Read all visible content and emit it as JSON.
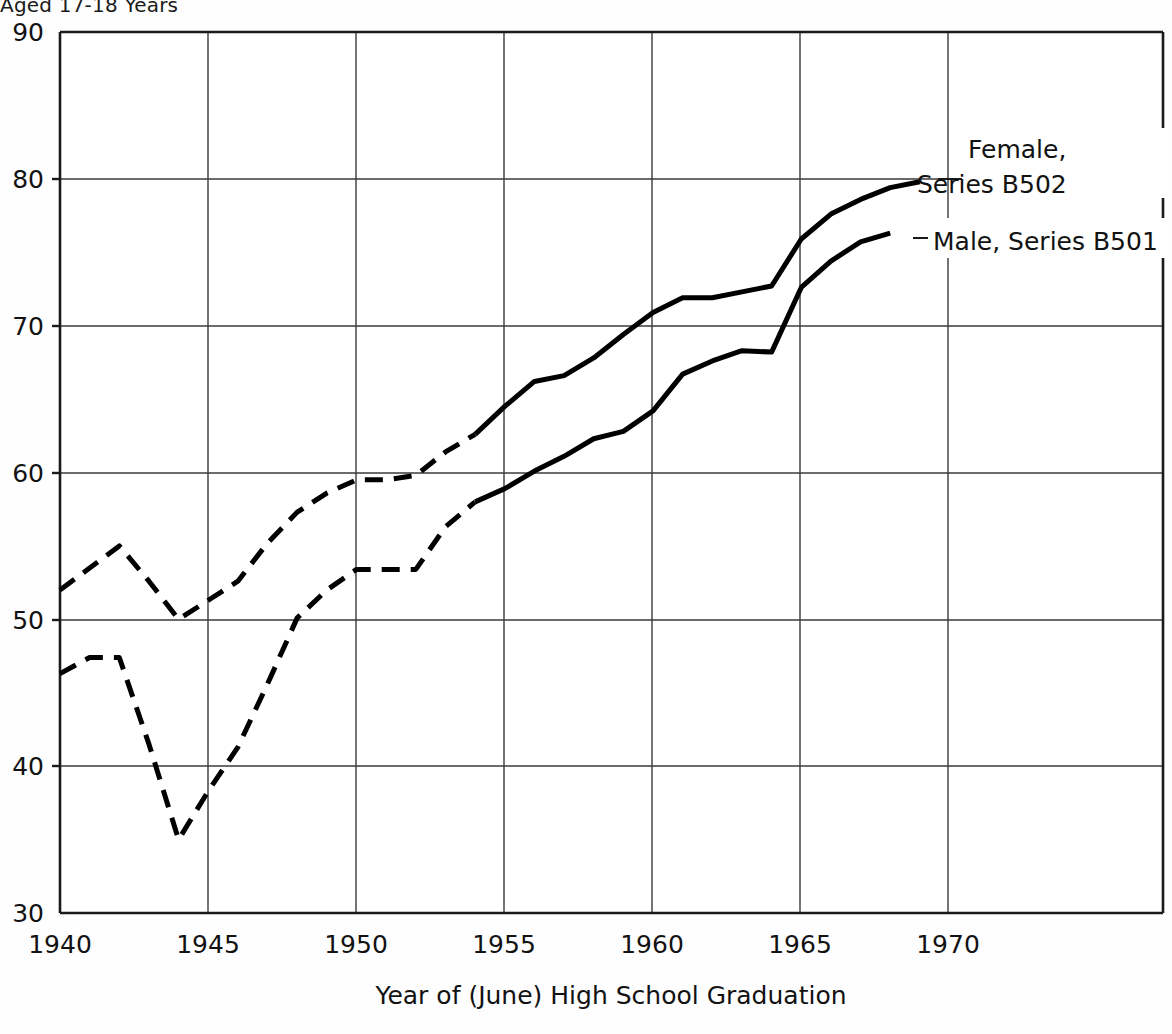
{
  "top_note": "Aged 17-18 Years",
  "chart_data": {
    "type": "line",
    "title": "",
    "xlabel": "Year of (June) High School Graduation",
    "ylabel": "",
    "xlim": [
      1940,
      1977.2
    ],
    "ylim": [
      30,
      90
    ],
    "grid": true,
    "legend_position": "right-inline",
    "x_ticks": [
      1940,
      1945,
      1950,
      1955,
      1960,
      1965,
      1970
    ],
    "x_tick_labels": [
      "1940",
      "1945",
      "1950",
      "1955",
      "1960",
      "1965",
      "1970"
    ],
    "y_ticks": [
      30,
      40,
      50,
      60,
      70,
      80,
      90
    ],
    "y_tick_labels": [
      "30",
      "40",
      "50",
      "60",
      "70",
      "80",
      "90"
    ],
    "series": [
      {
        "name": "Female, Series B502",
        "label_line1": "Female,",
        "label_line2": "Series B502",
        "color": "#000000",
        "estimated_until": 1954,
        "x": [
          1940,
          1941,
          1942,
          1943,
          1944,
          1945,
          1946,
          1947,
          1948,
          1949,
          1950,
          1951,
          1952,
          1953,
          1954,
          1955,
          1956,
          1957,
          1958,
          1959,
          1960,
          1961,
          1962,
          1963,
          1964,
          1965,
          1966,
          1967,
          1968,
          1969
        ],
        "values": [
          52.0,
          53.5,
          55.0,
          52.6,
          50.0,
          51.3,
          52.6,
          55.2,
          57.3,
          58.6,
          59.5,
          59.5,
          59.8,
          61.4,
          62.6,
          64.5,
          66.2,
          66.6,
          67.8,
          69.4,
          70.9,
          71.9,
          71.9,
          72.3,
          72.7,
          75.9,
          77.6,
          78.6,
          79.4,
          79.8
        ]
      },
      {
        "name": "Male, Series B501",
        "label_line1": "Male, Series B501",
        "color": "#000000",
        "estimated_until": 1954,
        "x": [
          1940,
          1941,
          1942,
          1943,
          1944,
          1945,
          1946,
          1947,
          1948,
          1949,
          1950,
          1951,
          1952,
          1953,
          1954,
          1955,
          1956,
          1957,
          1958,
          1959,
          1960,
          1961,
          1962,
          1963,
          1964,
          1965,
          1966,
          1967,
          1968
        ],
        "values": [
          46.3,
          47.4,
          47.4,
          41.5,
          35.0,
          38.3,
          41.3,
          45.6,
          50.1,
          52.0,
          53.4,
          53.4,
          53.4,
          56.3,
          58.0,
          58.9,
          60.1,
          61.1,
          62.3,
          62.8,
          64.2,
          66.7,
          67.6,
          68.3,
          68.2,
          72.6,
          74.4,
          75.7,
          76.3
        ]
      }
    ]
  }
}
